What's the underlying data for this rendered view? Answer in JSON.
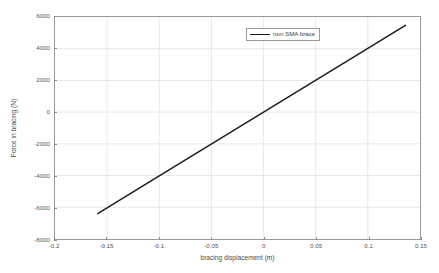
{
  "chart_data": {
    "type": "line",
    "title": "",
    "xlabel": "bracing displacement (m)",
    "ylabel": "Force in bracing (N)",
    "xlim": [
      -0.2,
      0.15
    ],
    "ylim": [
      -8000,
      6000
    ],
    "xticks": [
      -0.2,
      -0.15,
      -0.1,
      -0.05,
      0,
      0.05,
      0.1,
      0.15
    ],
    "xticklabels": [
      "-0.2",
      "-0.15",
      "-0.1",
      "-0.05",
      "0",
      "0.05",
      "0.1",
      "0.15"
    ],
    "yticks": [
      -8000,
      -6000,
      -4000,
      -2000,
      0,
      2000,
      4000,
      6000
    ],
    "yticklabels": [
      "-8000",
      "-6000",
      "-4000",
      "-2000",
      "0",
      "2000",
      "4000",
      "6000"
    ],
    "grid": true,
    "legend_position": "upper center",
    "series": [
      {
        "name": "non SMA brace",
        "color": "#1c1c1c",
        "linewidth": 1.5,
        "x": [
          -0.159,
          -0.12,
          -0.08,
          -0.04,
          0,
          0.04,
          0.08,
          0.136
        ],
        "y": [
          -6400,
          -4830,
          -3220,
          -1610,
          0,
          1610,
          3220,
          5470
        ]
      }
    ]
  },
  "legend": {
    "entries": [
      {
        "label": "non SMA brace"
      }
    ]
  },
  "axes": {
    "x_title": "bracing displacement (m)",
    "y_title": "Force in bracing (N)"
  }
}
